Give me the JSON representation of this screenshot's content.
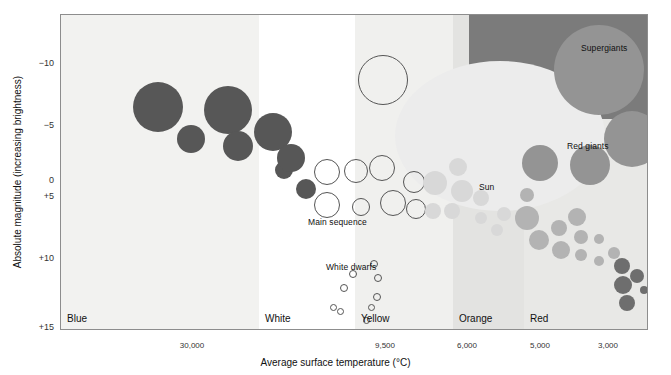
{
  "chart_data": {
    "type": "scatter",
    "xlabel": "Average surface temperature (°C)",
    "ylabel": "Absolute magnitude (increasing brightness)",
    "ylim": [
      -12.5,
      15
    ],
    "yticks": [
      "−10",
      "−5",
      "0",
      "+5",
      "+10",
      "+15"
    ],
    "ytick_values": [
      -10,
      -5,
      0,
      5,
      10,
      15
    ],
    "xticks": [
      "30,000",
      "9,500",
      "6,000",
      "5,000",
      "3,000"
    ],
    "xtick_values": [
      30000,
      9500,
      6000,
      5000,
      3000
    ],
    "grid": false,
    "legend": "none",
    "color_bands": [
      {
        "name": "Blue",
        "color": "#f2f2f0",
        "x0": 0,
        "x1": 198
      },
      {
        "name": "White",
        "color": "#ffffff",
        "x0": 198,
        "x1": 294
      },
      {
        "name": "Yellow",
        "color": "#f0f0ee",
        "x0": 294,
        "x1": 392
      },
      {
        "name": "Orange",
        "color": "#e3e3e1",
        "x0": 392,
        "x1": 463
      },
      {
        "name": "Red",
        "color": "#e8e8e6",
        "x0": 463,
        "x1": 588
      }
    ],
    "annotations": [
      {
        "text": "Supergiants",
        "x": 580,
        "y": 42
      },
      {
        "text": "Red giants",
        "x": 566,
        "y": 140
      },
      {
        "text": "Sun",
        "x": 478,
        "y": 181
      },
      {
        "text": "Main sequence",
        "x": 307,
        "y": 216
      },
      {
        "text": "White dwarfs",
        "x": 325,
        "y": 261
      }
    ],
    "groups": [
      {
        "name": "blue-giants",
        "fill": "#575757",
        "style": "solid",
        "points": [
          {
            "x": 97,
            "y": 92,
            "r": 25
          },
          {
            "x": 130,
            "y": 124,
            "r": 14
          },
          {
            "x": 167,
            "y": 95,
            "r": 24
          },
          {
            "x": 177,
            "y": 131,
            "r": 15
          },
          {
            "x": 212,
            "y": 117,
            "r": 19
          },
          {
            "x": 223,
            "y": 155,
            "r": 9
          },
          {
            "x": 230,
            "y": 143,
            "r": 14
          },
          {
            "x": 245,
            "y": 174,
            "r": 10
          }
        ]
      },
      {
        "name": "main-sequence-white",
        "fill": "none",
        "style": "hollow",
        "points": [
          {
            "x": 322,
            "y": 65,
            "r": 25
          },
          {
            "x": 266,
            "y": 157,
            "r": 13
          },
          {
            "x": 295,
            "y": 156,
            "r": 12
          },
          {
            "x": 321,
            "y": 153,
            "r": 13
          },
          {
            "x": 266,
            "y": 190,
            "r": 13
          },
          {
            "x": 300,
            "y": 192,
            "r": 9
          },
          {
            "x": 332,
            "y": 188,
            "r": 13
          },
          {
            "x": 353,
            "y": 167,
            "r": 11
          },
          {
            "x": 355,
            "y": 194,
            "r": 10
          }
        ]
      },
      {
        "name": "white-dwarfs",
        "fill": "none",
        "style": "hollow-small",
        "points": [
          {
            "x": 313,
            "y": 249,
            "r": 4
          },
          {
            "x": 292,
            "y": 259,
            "r": 4
          },
          {
            "x": 317,
            "y": 263,
            "r": 4
          },
          {
            "x": 283,
            "y": 273,
            "r": 4
          },
          {
            "x": 316,
            "y": 282,
            "r": 4
          },
          {
            "x": 272,
            "y": 292,
            "r": 3.5
          },
          {
            "x": 279,
            "y": 296,
            "r": 3.5
          },
          {
            "x": 310,
            "y": 292,
            "r": 3.5
          },
          {
            "x": 305,
            "y": 305,
            "r": 3.5
          }
        ]
      },
      {
        "name": "yellow-sequence",
        "fill": "#d8d8d8",
        "style": "solid",
        "points": [
          {
            "x": 397,
            "y": 152,
            "r": 9
          },
          {
            "x": 374,
            "y": 168,
            "r": 12
          },
          {
            "x": 401,
            "y": 176,
            "r": 11
          },
          {
            "x": 372,
            "y": 196,
            "r": 8
          },
          {
            "x": 391,
            "y": 196,
            "r": 8
          },
          {
            "x": 420,
            "y": 183,
            "r": 8
          },
          {
            "x": 420,
            "y": 203,
            "r": 6
          },
          {
            "x": 443,
            "y": 199,
            "r": 7
          },
          {
            "x": 436,
            "y": 215,
            "r": 6
          }
        ]
      },
      {
        "name": "red-giants",
        "fill": "#949494",
        "style": "solid",
        "points": [
          {
            "x": 538,
            "y": 55,
            "r": 45
          },
          {
            "x": 571,
            "y": 124,
            "r": 28
          },
          {
            "x": 529,
            "y": 150,
            "r": 20
          },
          {
            "x": 479,
            "y": 148,
            "r": 18
          }
        ]
      },
      {
        "name": "orange-sequence",
        "fill": "#b3b3b3",
        "style": "solid",
        "points": [
          {
            "x": 466,
            "y": 180,
            "r": 7
          },
          {
            "x": 466,
            "y": 203,
            "r": 12
          },
          {
            "x": 478,
            "y": 225,
            "r": 10
          },
          {
            "x": 498,
            "y": 213,
            "r": 8
          },
          {
            "x": 500,
            "y": 235,
            "r": 9
          },
          {
            "x": 516,
            "y": 202,
            "r": 9
          },
          {
            "x": 520,
            "y": 222,
            "r": 7
          },
          {
            "x": 520,
            "y": 240,
            "r": 6
          },
          {
            "x": 538,
            "y": 224,
            "r": 5
          },
          {
            "x": 538,
            "y": 246,
            "r": 5
          },
          {
            "x": 553,
            "y": 238,
            "r": 6
          }
        ]
      },
      {
        "name": "red-dwarfs",
        "fill": "#6e6e6e",
        "style": "solid",
        "points": [
          {
            "x": 561,
            "y": 251,
            "r": 8
          },
          {
            "x": 576,
            "y": 261,
            "r": 7
          },
          {
            "x": 562,
            "y": 270,
            "r": 9
          },
          {
            "x": 583,
            "y": 275,
            "r": 4
          },
          {
            "x": 566,
            "y": 288,
            "r": 8
          }
        ]
      }
    ]
  },
  "axes": {
    "y_label": "Absolute magnitude (increasing brightness)",
    "x_label": "Average surface temperature (°C)",
    "y_ticks": [
      {
        "label": "−10",
        "top": 63
      },
      {
        "label": "−5",
        "top": 125
      },
      {
        "label": "0",
        "top": 180
      },
      {
        "label": "+5",
        "top": 196
      },
      {
        "label": "+10",
        "top": 258
      },
      {
        "label": "+15",
        "top": 327
      }
    ],
    "x_ticks": [
      {
        "label": "30,000",
        "left": 192
      },
      {
        "label": "9,500",
        "left": 385
      },
      {
        "label": "6,000",
        "left": 467
      },
      {
        "label": "5,000",
        "left": 540
      },
      {
        "label": "3,000",
        "left": 608
      }
    ]
  },
  "color_labels": [
    {
      "label": "Blue",
      "left": 6
    },
    {
      "label": "White",
      "left": 204
    },
    {
      "label": "Yellow",
      "left": 300
    },
    {
      "label": "Orange",
      "left": 398
    },
    {
      "label": "Red",
      "left": 469
    }
  ],
  "colors": {
    "frame": "#8d8d8d",
    "supergiant_zone": "#7b7b7b",
    "blue_star": "#575757",
    "red_giant": "#949494",
    "orange_star": "#b3b3b3",
    "yellow_star": "#d8d8d8",
    "red_dwarf": "#6e6e6e",
    "text": "#111111"
  }
}
